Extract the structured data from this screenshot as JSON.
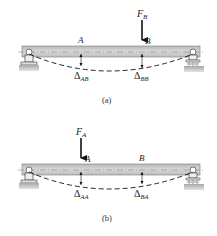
{
  "diagrams": [
    {
      "id": "a",
      "caption": "(a)",
      "force": {
        "label": "F",
        "sub": "B",
        "at_point": "B"
      },
      "points": [
        {
          "label": "A",
          "deflection_label": "Δ",
          "deflection_sub": "AB"
        },
        {
          "label": "B",
          "deflection_label": "Δ",
          "deflection_sub": "BB"
        }
      ]
    },
    {
      "id": "b",
      "caption": "(b)",
      "force": {
        "label": "F",
        "sub": "A",
        "at_point": "A"
      },
      "points": [
        {
          "label": "A",
          "deflection_label": "Δ",
          "deflection_sub": "AA"
        },
        {
          "label": "B",
          "deflection_label": "Δ",
          "deflection_sub": "BA"
        }
      ]
    }
  ],
  "colors": {
    "beam_fill": "#c9c9c9",
    "beam_edge": "#8a8a8a",
    "ground": "#b5b5b5",
    "ink": "#111111"
  }
}
